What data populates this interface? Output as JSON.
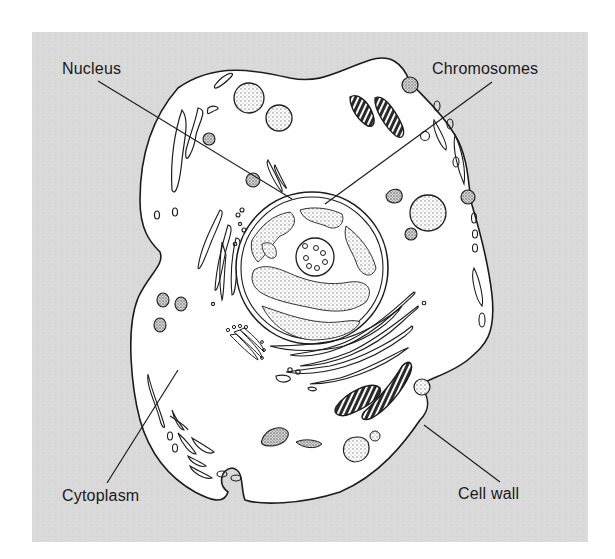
{
  "diagram": {
    "colors": {
      "background_panel": "#d9d9d9",
      "cell_fill": "#ffffff",
      "stroke": "#1c1c1c",
      "stipple": "#8a8a8a",
      "text": "#1a1a1a"
    },
    "panel": {
      "x": 32,
      "y": 32,
      "width": 556,
      "height": 510
    },
    "labels": [
      {
        "id": "nucleus",
        "text": "Nucleus",
        "x": 62,
        "y": 61,
        "line": {
          "x1": 98,
          "y1": 81,
          "x2": 292,
          "y2": 199
        }
      },
      {
        "id": "chromosomes",
        "text": "Chromosomes",
        "x": 432,
        "y": 61,
        "line": {
          "x1": 492,
          "y1": 82,
          "x2": 325,
          "y2": 204
        }
      },
      {
        "id": "cytoplasm",
        "text": "Cytoplasm",
        "x": 62,
        "y": 488,
        "line": {
          "x1": 107,
          "y1": 483,
          "x2": 178,
          "y2": 370
        }
      },
      {
        "id": "cell-wall",
        "text": "Cell wall",
        "x": 458,
        "y": 486,
        "line": {
          "x1": 500,
          "y1": 482,
          "x2": 424,
          "y2": 425
        }
      }
    ]
  }
}
